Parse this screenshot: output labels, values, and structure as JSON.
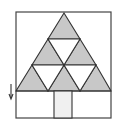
{
  "diagram": {
    "frame": {
      "x": 16,
      "y": 12,
      "width": 95,
      "height": 106
    },
    "triangle": {
      "apex": [
        64,
        13
      ],
      "base_left": [
        16,
        91
      ],
      "base_right": [
        111,
        91
      ]
    },
    "rows_y": [
      13,
      39,
      65,
      91
    ],
    "shaded_color": "#c8c8c8",
    "line_color": "#333333",
    "trunk": {
      "x": 54,
      "y": 91,
      "width": 18,
      "height": 27,
      "fill": "#f0f0f0"
    },
    "arrow": {
      "x": 11,
      "y1": 84,
      "y2": 99,
      "direction": "down"
    },
    "shaded_triangles_count": 6,
    "unshaded_triangles_count": 3
  }
}
